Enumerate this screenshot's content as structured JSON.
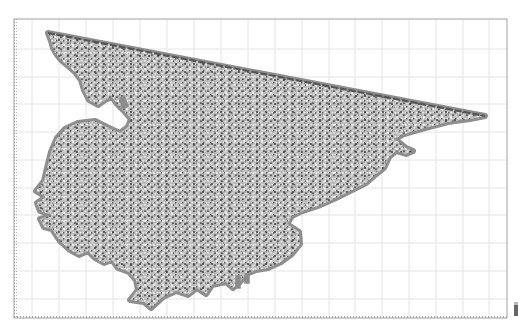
{
  "figure": {
    "type": "triangular-mesh-plot",
    "frame": {
      "x": 14,
      "y": 19,
      "width": 493,
      "height": 299
    },
    "grid": {
      "visible": true,
      "vertical_lines_x": [
        32,
        59,
        86,
        113,
        140,
        167,
        194,
        221,
        248,
        275,
        302,
        329,
        355,
        382,
        409,
        436,
        463,
        489
      ],
      "horizontal_lines_y": [
        49,
        77,
        104,
        132,
        160,
        188,
        215,
        243,
        271,
        299
      ]
    },
    "colors": {
      "background": "#ffffff",
      "frame": "#9a9a9a",
      "grid": "#e4e4e4",
      "coast_halo": "#8c8c8c",
      "mesh_fill": "#b9b9b9",
      "mesh_node": "#3c3c3c",
      "mesh_light": "#f2f2f2",
      "open_boundary": "#555555"
    },
    "open_boundary": {
      "from": [
        48,
        33
      ],
      "to": [
        485,
        116
      ],
      "style": "dashed"
    },
    "mesh_outline": [
      [
        48,
        33
      ],
      [
        485,
        116
      ],
      [
        470,
        119
      ],
      [
        448,
        122
      ],
      [
        425,
        128
      ],
      [
        404,
        134
      ],
      [
        394,
        139
      ],
      [
        400,
        143
      ],
      [
        406,
        148
      ],
      [
        413,
        151
      ],
      [
        406,
        154
      ],
      [
        396,
        151
      ],
      [
        389,
        157
      ],
      [
        384,
        168
      ],
      [
        374,
        176
      ],
      [
        366,
        183
      ],
      [
        352,
        190
      ],
      [
        336,
        198
      ],
      [
        318,
        206
      ],
      [
        300,
        212
      ],
      [
        292,
        216
      ],
      [
        287,
        224
      ],
      [
        299,
        232
      ],
      [
        300,
        244
      ],
      [
        292,
        254
      ],
      [
        281,
        262
      ],
      [
        268,
        268
      ],
      [
        256,
        270
      ],
      [
        246,
        274
      ],
      [
        240,
        282
      ],
      [
        233,
        288
      ],
      [
        226,
        282
      ],
      [
        212,
        285
      ],
      [
        206,
        294
      ],
      [
        197,
        288
      ],
      [
        188,
        295
      ],
      [
        176,
        291
      ],
      [
        163,
        297
      ],
      [
        151,
        308
      ],
      [
        144,
        302
      ],
      [
        130,
        300
      ],
      [
        138,
        290
      ],
      [
        136,
        280
      ],
      [
        129,
        272
      ],
      [
        118,
        268
      ],
      [
        112,
        260
      ],
      [
        104,
        263
      ],
      [
        95,
        258
      ],
      [
        88,
        251
      ],
      [
        79,
        255
      ],
      [
        70,
        250
      ],
      [
        60,
        241
      ],
      [
        52,
        229
      ],
      [
        44,
        227
      ],
      [
        40,
        219
      ],
      [
        52,
        215
      ],
      [
        40,
        211
      ],
      [
        37,
        203
      ],
      [
        46,
        197
      ],
      [
        36,
        191
      ],
      [
        44,
        181
      ],
      [
        47,
        168
      ],
      [
        51,
        152
      ],
      [
        57,
        138
      ],
      [
        65,
        129
      ],
      [
        78,
        123
      ],
      [
        95,
        121
      ],
      [
        109,
        128
      ],
      [
        120,
        133
      ],
      [
        128,
        127
      ],
      [
        131,
        119
      ],
      [
        124,
        111
      ],
      [
        117,
        104
      ],
      [
        112,
        97
      ],
      [
        105,
        100
      ],
      [
        98,
        105
      ],
      [
        89,
        100
      ],
      [
        84,
        90
      ],
      [
        81,
        80
      ],
      [
        75,
        72
      ],
      [
        67,
        65
      ],
      [
        61,
        60
      ],
      [
        57,
        55
      ],
      [
        53,
        48
      ],
      [
        51,
        41
      ],
      [
        48,
        33
      ]
    ],
    "islands_and_stubs": [
      {
        "name": "south-stub-1",
        "points": [
          [
            236,
            276
          ],
          [
            240,
            276
          ],
          [
            240,
            288
          ],
          [
            236,
            288
          ]
        ]
      },
      {
        "name": "south-stub-2",
        "points": [
          [
            245,
            274
          ],
          [
            249,
            274
          ],
          [
            249,
            283
          ],
          [
            245,
            283
          ]
        ]
      },
      {
        "name": "bay-spit",
        "points": [
          [
            120,
            98
          ],
          [
            124,
            96
          ],
          [
            128,
            106
          ],
          [
            122,
            108
          ]
        ]
      }
    ]
  }
}
